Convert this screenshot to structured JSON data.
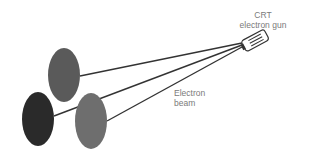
{
  "diagram": {
    "labels": {
      "crt_line1": "CRT",
      "crt_line2": "electron gun",
      "beam_line1": "Electron",
      "beam_line2": "beam"
    },
    "dots": [
      {
        "name": "top-phosphor-dot",
        "color": "#5a5a5a"
      },
      {
        "name": "left-phosphor-dot",
        "color": "#2a2a2a"
      },
      {
        "name": "right-phosphor-dot",
        "color": "#6e6e6e"
      }
    ],
    "colors": {
      "beam": "#333333",
      "gun_outline": "#333333",
      "label_text": "#7a7a7a"
    }
  }
}
